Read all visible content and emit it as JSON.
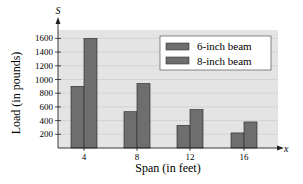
{
  "chart_data": {
    "type": "bar",
    "title": "",
    "xlabel": "Span (in feet)",
    "ylabel": "Load (in pounds)",
    "x_axis_var": "x",
    "y_axis_var": "S",
    "categories": [
      "4",
      "8",
      "12",
      "16"
    ],
    "series": [
      {
        "name": "6-inch beam",
        "values": [
          900,
          530,
          330,
          220
        ]
      },
      {
        "name": "8-inch beam",
        "values": [
          1600,
          940,
          560,
          380
        ]
      }
    ],
    "yticks": [
      200,
      400,
      600,
      800,
      1000,
      1200,
      1400,
      1600
    ],
    "ylim": [
      0,
      1700
    ],
    "grid": true,
    "legend_position": "upper right",
    "colors": {
      "bar": "#6e6e6e",
      "bar_border": "#333333",
      "plot_bg": "#e4e4e4",
      "grid": "#c8c8c8"
    }
  }
}
